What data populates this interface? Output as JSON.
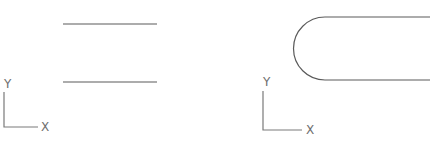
{
  "diagram": {
    "panels": [
      {
        "name": "parallel-lines",
        "lines": [
          {
            "x1": 63,
            "y1": 24,
            "x2": 157,
            "y2": 24
          },
          {
            "x1": 63,
            "y1": 82,
            "x2": 157,
            "y2": 82
          }
        ],
        "ucs": {
          "origin": [
            4,
            127
          ],
          "y_end": [
            4,
            92
          ],
          "x_end": [
            38,
            127
          ],
          "y_label": "Y",
          "x_label": "X",
          "y_label_pos": [
            4,
            88
          ],
          "x_label_pos": [
            41,
            131
          ]
        }
      },
      {
        "name": "filleted-lines",
        "lines": [
          {
            "x1": 325,
            "y1": 17,
            "x2": 430,
            "y2": 17
          },
          {
            "x1": 325,
            "y1": 80,
            "x2": 430,
            "y2": 80
          }
        ],
        "arc": {
          "start": [
            325,
            17
          ],
          "end": [
            325,
            80
          ],
          "radius": 31.5
        },
        "ucs": {
          "origin": [
            263,
            130
          ],
          "y_end": [
            263,
            91
          ],
          "x_end": [
            302,
            130
          ],
          "y_label": "Y",
          "x_label": "X",
          "y_label_pos": [
            263,
            86
          ],
          "x_label_pos": [
            306,
            134
          ]
        }
      }
    ],
    "colors": {
      "stroke": "#5a5a5a",
      "axis": "#7a7a7a",
      "background": "#ffffff"
    }
  }
}
